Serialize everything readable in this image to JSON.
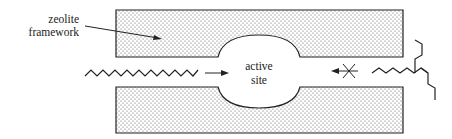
{
  "diagram": {
    "type": "zeolite shape-selective catalysis schematic",
    "labels": {
      "framework_line1": "zeolite",
      "framework_line2": "framework",
      "site_line1": "active",
      "site_line2": "site"
    },
    "molecules": [
      {
        "name": "linear alkane",
        "side": "left",
        "enters": true
      },
      {
        "name": "branched alkane",
        "side": "right",
        "enters": false
      }
    ],
    "arrows": [
      {
        "from": "linear alkane",
        "to": "active site",
        "blocked": false
      },
      {
        "from": "branched alkane",
        "to": "active site",
        "blocked": true
      }
    ],
    "colors": {
      "line": "#222222",
      "dots": "#555555",
      "background": "#ffffff"
    }
  }
}
